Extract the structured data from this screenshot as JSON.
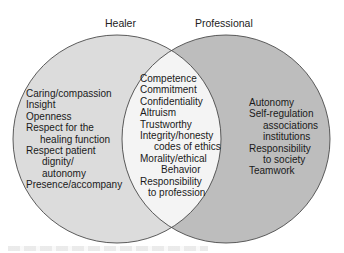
{
  "diagram": {
    "type": "venn",
    "colors": {
      "healer_fill": "#dcdcdc",
      "professional_fill": "#bdbdbd",
      "overlap_fill": "#f4f4f4",
      "outline": "#4a4a4a",
      "background": "#ffffff"
    },
    "sets": {
      "healer": {
        "label": "Healer",
        "items": [
          {
            "text": "Caring/compassion"
          },
          {
            "text": "Insight"
          },
          {
            "text": "Openness"
          },
          {
            "text": "Respect for the",
            "cont": "healing function"
          },
          {
            "text": "Respect patient",
            "cont": "dignity/",
            "cont2": "autonomy"
          },
          {
            "text": "Presence/accompany"
          }
        ]
      },
      "shared": {
        "items": [
          {
            "text": "Competence"
          },
          {
            "text": "Commitment"
          },
          {
            "text": "Confidentiality"
          },
          {
            "text": "Altruism"
          },
          {
            "text": "Trustworthy"
          },
          {
            "text": "Integrity/honesty",
            "cont": "codes of ethics"
          },
          {
            "text": "Morality/ethical",
            "cont": "Behavior"
          },
          {
            "text": "Responsibility",
            "cont": "to profession"
          }
        ]
      },
      "professional": {
        "label": "Professional",
        "items": [
          {
            "text": "Autonomy"
          },
          {
            "text": "Self-regulation",
            "cont": "associations",
            "cont2": "institutions"
          },
          {
            "text": "Responsibility",
            "cont": "to society"
          },
          {
            "text": "Teamwork"
          }
        ]
      }
    }
  }
}
